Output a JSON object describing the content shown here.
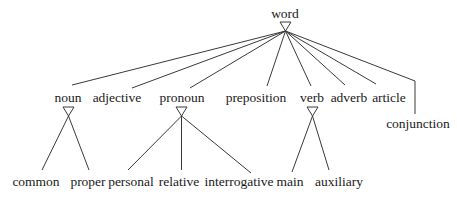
{
  "diagram": {
    "type": "tree",
    "root": {
      "label": "word"
    },
    "level1": [
      {
        "label": "noun"
      },
      {
        "label": "adjective"
      },
      {
        "label": "pronoun"
      },
      {
        "label": "preposition"
      },
      {
        "label": "verb"
      },
      {
        "label": "adverb"
      },
      {
        "label": "article"
      },
      {
        "label": "conjunction"
      }
    ],
    "level2": {
      "noun": [
        {
          "label": "common"
        },
        {
          "label": "proper"
        }
      ],
      "pronoun": [
        {
          "label": "personal"
        },
        {
          "label": "relative"
        },
        {
          "label": "interrogative"
        }
      ],
      "verb": [
        {
          "label": "main"
        },
        {
          "label": "auxiliary"
        }
      ]
    },
    "colors": {
      "line": "#3a3a3a",
      "text": "#1a1a1a",
      "background": "#ffffff"
    }
  }
}
